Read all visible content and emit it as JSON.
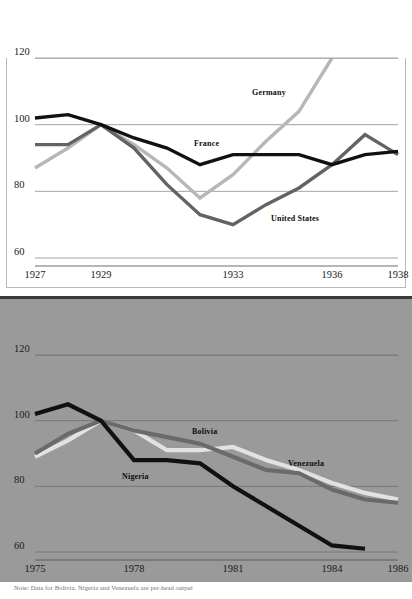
{
  "figure": {
    "footnote": "Note: Data for Bolivia, Nigeria and Venezuela are per-head output"
  },
  "panels": [
    {
      "key": "great_depression",
      "title": "Great Depression",
      "subtitle": "Index (1929 = 100)",
      "background": "#ffffff",
      "series_labels": [
        {
          "name": "Germany",
          "x": 252,
          "y": 88
        },
        {
          "name": "France",
          "x": 194,
          "y": 139
        },
        {
          "name": "United States",
          "x": 271,
          "y": 214
        }
      ]
    },
    {
      "key": "current_crisis",
      "title": "Current crisis",
      "subtitle": "Index (1977 = 100)",
      "background": "#9a9a9a",
      "series_labels": [
        {
          "name": "Bolivia",
          "x": 192,
          "y": 427
        },
        {
          "name": "Venezuela",
          "x": 288,
          "y": 459
        },
        {
          "name": "Nigeria",
          "x": 122,
          "y": 472
        }
      ]
    }
  ],
  "chart_data": [
    {
      "type": "line",
      "title": "Great Depression",
      "subtitle": "Index (1929 = 100)",
      "xlabel": "",
      "ylabel": "Index (1929 = 100)",
      "ylim": [
        60,
        120
      ],
      "yticks": [
        60,
        80,
        100,
        120
      ],
      "xticks": [
        "1927",
        "1929",
        "1933",
        "1936",
        "1938"
      ],
      "xlim": [
        "1927",
        "1938"
      ],
      "grid": true,
      "legend": "inline-labels",
      "colors": {
        "France": "#111111",
        "United States": "#636363",
        "Germany": "#b7b7b7"
      },
      "x": [
        1927,
        1928,
        1929,
        1930,
        1931,
        1932,
        1933,
        1934,
        1935,
        1936,
        1937,
        1938
      ],
      "series": [
        {
          "name": "France",
          "color": "#111111",
          "values": [
            102,
            103,
            100,
            96,
            93,
            88,
            91,
            91,
            91,
            88,
            91,
            92
          ]
        },
        {
          "name": "United States",
          "color": "#636363",
          "values": [
            94,
            94,
            100,
            93,
            82,
            73,
            70,
            76,
            81,
            88,
            97,
            91
          ]
        },
        {
          "name": "Germany",
          "color": "#b7b7b7",
          "values": [
            87,
            93,
            100,
            94,
            87,
            78,
            85,
            95,
            104,
            120,
            null,
            null
          ]
        }
      ]
    },
    {
      "type": "line",
      "title": "Current crisis",
      "subtitle": "Index (1977 = 100)",
      "xlabel": "",
      "ylabel": "Index (1977 = 100)",
      "ylim": [
        60,
        120
      ],
      "yticks": [
        60,
        80,
        100,
        120
      ],
      "xticks": [
        "1975",
        "1978",
        "1981",
        "1984",
        "1986"
      ],
      "xlim": [
        "1975",
        "1986"
      ],
      "grid": true,
      "legend": "inline-labels",
      "colors": {
        "Nigeria": "#111111",
        "Bolivia": "#6a6a6a",
        "Venezuela": "#e2e2e2"
      },
      "x": [
        1975,
        1976,
        1977,
        1978,
        1979,
        1980,
        1981,
        1982,
        1983,
        1984,
        1985,
        1986
      ],
      "series": [
        {
          "name": "Nigeria",
          "color": "#111111",
          "values": [
            102,
            105,
            100,
            88,
            88,
            87,
            80,
            74,
            68,
            62,
            61,
            null
          ]
        },
        {
          "name": "Bolivia",
          "color": "#6a6a6a",
          "values": [
            90,
            96,
            100,
            97,
            95,
            93,
            89,
            85,
            84,
            79,
            76,
            75
          ]
        },
        {
          "name": "Venezuela",
          "color": "#e2e2e2",
          "values": [
            89,
            94,
            100,
            97,
            91,
            91,
            92,
            88,
            85,
            81,
            78,
            76
          ]
        }
      ]
    }
  ]
}
